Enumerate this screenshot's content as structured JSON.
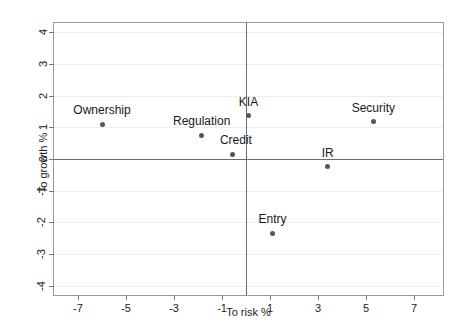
{
  "chart_data": {
    "type": "scatter",
    "title": "",
    "xlabel": "To risk %",
    "ylabel": "To growth %",
    "xlim": [
      -8,
      8.2
    ],
    "ylim": [
      -4.3,
      4.3
    ],
    "xticks": [
      -7,
      -5,
      -3,
      -1,
      1,
      3,
      5,
      7
    ],
    "xtick_labels": [
      "-7",
      "-5",
      "-3",
      "-1",
      "1",
      "3",
      "5",
      "7"
    ],
    "yticks": [
      4,
      3,
      2,
      1,
      0,
      -1,
      -2,
      -3,
      -4
    ],
    "ytick_labels": [
      "4",
      "3",
      "2",
      "1",
      "0",
      "-1",
      "-2",
      "-3",
      "-4"
    ],
    "grid": "horizontal-light",
    "legend": "none",
    "zero_lines": true,
    "points": [
      {
        "label": "Ownership",
        "x": -6.0,
        "y": 1.1,
        "label_dx": 0,
        "label_dy": -7
      },
      {
        "label": "Regulation",
        "x": -1.85,
        "y": 0.75,
        "label_dx": 0,
        "label_dy": -7
      },
      {
        "label": "Credit",
        "x": -0.55,
        "y": 0.15,
        "label_dx": 3,
        "label_dy": -7
      },
      {
        "label": "KIA",
        "x": 0.1,
        "y": 1.37,
        "label_dx": 0,
        "label_dy": -7
      },
      {
        "label": "Security",
        "x": 5.3,
        "y": 1.18,
        "label_dx": 0,
        "label_dy": -7
      },
      {
        "label": "IR",
        "x": 3.4,
        "y": -0.25,
        "label_dx": 0,
        "label_dy": -7
      },
      {
        "label": "Entry",
        "x": 1.1,
        "y": -2.35,
        "label_dx": 0,
        "label_dy": -7
      }
    ]
  },
  "colors": {
    "point": "#555555",
    "frame": "#9a9a9a",
    "zero_axis": "#6b6b6b",
    "gridline": "#ededed",
    "text": "#1a1a1a",
    "background": "#ffffff"
  }
}
